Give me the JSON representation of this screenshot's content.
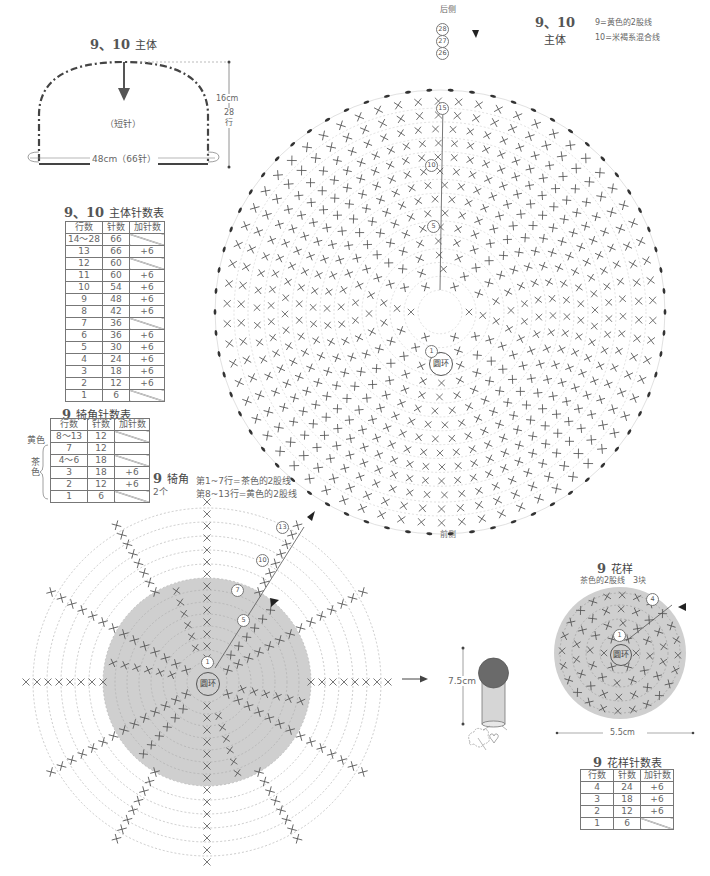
{
  "body_shape": {
    "title_num": "9、10",
    "title": "主体",
    "stitch_label": "（短针）",
    "width_label": "48cm（66针）",
    "height_label": "16cm",
    "rows_label": "28",
    "rows_unit": "行"
  },
  "body_table": {
    "title_num": "9、10",
    "title": "主体针数表",
    "headers": [
      "行数",
      "针数",
      "加针数"
    ],
    "rows": [
      {
        "row": "14～28",
        "count": "66",
        "inc": ""
      },
      {
        "row": "13",
        "count": "66",
        "inc": "+6"
      },
      {
        "row": "12",
        "count": "60",
        "inc": ""
      },
      {
        "row": "11",
        "count": "60",
        "inc": "+6"
      },
      {
        "row": "10",
        "count": "54",
        "inc": "+6"
      },
      {
        "row": "9",
        "count": "48",
        "inc": "+6"
      },
      {
        "row": "8",
        "count": "42",
        "inc": "+6"
      },
      {
        "row": "7",
        "count": "36",
        "inc": ""
      },
      {
        "row": "6",
        "count": "36",
        "inc": "+6"
      },
      {
        "row": "5",
        "count": "30",
        "inc": "+6"
      },
      {
        "row": "4",
        "count": "24",
        "inc": "+6"
      },
      {
        "row": "3",
        "count": "18",
        "inc": "+6"
      },
      {
        "row": "2",
        "count": "12",
        "inc": "+6"
      },
      {
        "row": "1",
        "count": "6",
        "inc": ""
      }
    ]
  },
  "brim_table": {
    "title_num": "9",
    "title": "犄角针数表",
    "headers": [
      "行数",
      "针数",
      "加针数"
    ],
    "color_yellow": "黄色",
    "color_brown": "茶色",
    "rows": [
      {
        "row": "8～13",
        "count": "12",
        "inc": ""
      },
      {
        "row": "7",
        "count": "12",
        "inc": ""
      },
      {
        "row": "4～6",
        "count": "18",
        "inc": ""
      },
      {
        "row": "3",
        "count": "18",
        "inc": "+6"
      },
      {
        "row": "2",
        "count": "12",
        "inc": "+6"
      },
      {
        "row": "1",
        "count": "6",
        "inc": ""
      }
    ]
  },
  "main_chart": {
    "title_num": "9、10",
    "title": "主体",
    "legend_9": "9=黄色的2股线",
    "legend_10": "10=米褐系混合线",
    "back_label": "后侧",
    "front_label": "前侧",
    "center_label": "圆环",
    "row_markers": [
      "28",
      "27",
      "26",
      "15",
      "10",
      "5",
      "1"
    ]
  },
  "horn_chart": {
    "title_num": "9",
    "title": "犄角",
    "qty": "2个",
    "note_1": "第1~7行=茶色的2股线",
    "note_2": "第8~13行=黄色的2股线",
    "center_label": "圆环",
    "row_markers": [
      "13",
      "10",
      "7",
      "5",
      "1"
    ]
  },
  "horn_finish": {
    "height_label": "7.5cm"
  },
  "flower_chart": {
    "title_num": "9",
    "title": "花样",
    "subtitle": "茶色的2股线　3块",
    "center_label": "圆环",
    "row_markers": [
      "4",
      "1"
    ],
    "width_label": "5.5cm"
  },
  "flower_table": {
    "title_num": "9",
    "title": "花样针数表",
    "headers": [
      "行数",
      "针数",
      "加针数"
    ],
    "rows": [
      {
        "row": "4",
        "count": "24",
        "inc": "+6"
      },
      {
        "row": "3",
        "count": "18",
        "inc": "+6"
      },
      {
        "row": "2",
        "count": "12",
        "inc": "+6"
      },
      {
        "row": "1",
        "count": "6",
        "inc": ""
      }
    ]
  },
  "colors": {
    "line": "#555555",
    "gray_fill": "#cfcfcf",
    "dashed": "#bbbbbb",
    "dark_fill": "#666666"
  }
}
